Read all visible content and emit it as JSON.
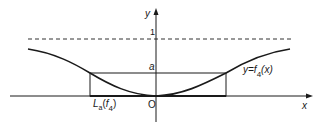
{
  "diagram": {
    "axes": {
      "x_label": "x",
      "y_label": "y",
      "origin_label": "O"
    },
    "ticks": {
      "one_label": "1",
      "a_label": "a"
    },
    "curve_label": {
      "prefix": "y=",
      "func": "f",
      "subscript": "4",
      "arg": "(x)"
    },
    "set_label": {
      "func": "L",
      "subscript": "a",
      "arg_open": "(",
      "arg_func": "f",
      "arg_subscript": "4",
      "arg_close": ")"
    },
    "colors": {
      "ink": "#1a1a1a",
      "background": "#ffffff"
    }
  }
}
